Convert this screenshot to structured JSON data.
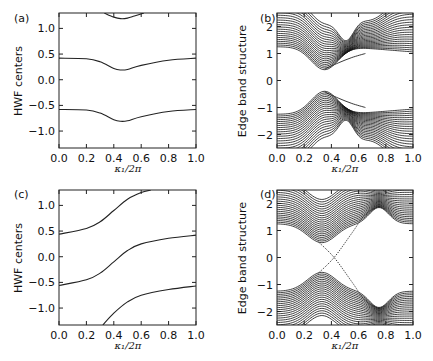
{
  "chart_data": [
    {
      "panel": "(a)",
      "type": "line",
      "xlabel": "κ₁/2π",
      "ylabel": "HWF centers",
      "xlim": [
        0.0,
        1.0
      ],
      "ylim": [
        -1.33,
        1.3
      ],
      "xticks": [
        "0.0",
        "0.2",
        "0.4",
        "0.6",
        "0.8",
        "1.0"
      ],
      "yticks": [
        "1.0",
        "0.5",
        "0.0",
        "−0.5",
        "−1.0"
      ],
      "ytick_values": [
        1.0,
        0.5,
        0.0,
        -0.5,
        -1.0
      ],
      "grid": false,
      "series": [
        {
          "name": "branch 1",
          "x": [
            0.0,
            0.2,
            0.3,
            0.4,
            0.45,
            0.5,
            0.6,
            0.8,
            1.0
          ],
          "values": [
            0.42,
            0.41,
            0.35,
            0.22,
            0.19,
            0.2,
            0.28,
            0.38,
            0.42
          ]
        },
        {
          "name": "branch 2",
          "x": [
            0.0,
            0.2,
            0.3,
            0.4,
            0.45,
            0.5,
            0.6,
            0.8,
            1.0
          ],
          "values": [
            -0.58,
            -0.59,
            -0.65,
            -0.78,
            -0.81,
            -0.8,
            -0.72,
            -0.62,
            -0.58
          ]
        },
        {
          "name": "branch 3",
          "x": [
            0.33,
            0.4,
            0.45,
            0.5,
            0.55,
            0.62
          ],
          "values": [
            1.3,
            1.22,
            1.19,
            1.2,
            1.24,
            1.3
          ]
        }
      ]
    },
    {
      "panel": "(b)",
      "type": "line",
      "xlabel": "κ₁/2π",
      "ylabel": "Edge band structure",
      "xlim": [
        0.0,
        1.0
      ],
      "ylim": [
        -2.5,
        2.5
      ],
      "xticks": [
        "0.0",
        "0.2",
        "0.4",
        "0.6",
        "0.8",
        "1.0"
      ],
      "yticks": [
        "2",
        "1",
        "0",
        "−1",
        "−2"
      ],
      "ytick_values": [
        2,
        1,
        0,
        -1,
        -2
      ],
      "grid": false,
      "description": "Dense bulk bands (~20 lines each) above and below a gap; upper bulk band minimum ≈0.4 at κ≈0.35, lower bulk band maximum ≈−0.4 at κ≈0.35; band crossings near κ≈0.52 at ±1.2; an edge state runs from ≈0.4 at κ≈0.35 to ≈1.0 at κ≈0.65 (upper) and mirrored in lower band; gapped (no crossing of zero).",
      "edge_states": [
        {
          "name": "upper edge state",
          "x": [
            0.35,
            0.45,
            0.55,
            0.65
          ],
          "values": [
            0.42,
            0.65,
            0.85,
            1.0
          ]
        },
        {
          "name": "lower edge state",
          "x": [
            0.35,
            0.45,
            0.55,
            0.65
          ],
          "values": [
            -0.42,
            -0.65,
            -0.85,
            -1.0
          ]
        }
      ]
    },
    {
      "panel": "(c)",
      "type": "line",
      "xlabel": "κ₁/2π",
      "ylabel": "HWF centers",
      "xlim": [
        0.0,
        1.0
      ],
      "ylim": [
        -1.33,
        1.3
      ],
      "xticks": [
        "0.0",
        "0.2",
        "0.4",
        "0.6",
        "0.8",
        "1.0"
      ],
      "yticks": [
        "1.0",
        "0.5",
        "0.0",
        "−0.5",
        "−1.0"
      ],
      "ytick_values": [
        1.0,
        0.5,
        0.0,
        -0.5,
        -1.0
      ],
      "grid": false,
      "series": [
        {
          "name": "branch 1",
          "x": [
            0.0,
            0.2,
            0.3,
            0.4,
            0.5,
            0.6,
            0.67
          ],
          "values": [
            0.44,
            0.55,
            0.68,
            0.9,
            1.12,
            1.25,
            1.3
          ]
        },
        {
          "name": "branch 2",
          "x": [
            0.0,
            0.2,
            0.3,
            0.4,
            0.5,
            0.6,
            0.8,
            1.0
          ],
          "values": [
            -0.56,
            -0.45,
            -0.32,
            -0.1,
            0.12,
            0.25,
            0.36,
            0.42
          ]
        },
        {
          "name": "branch 3",
          "x": [
            0.32,
            0.4,
            0.5,
            0.6,
            0.8,
            1.0
          ],
          "values": [
            -1.33,
            -1.1,
            -0.88,
            -0.75,
            -0.64,
            -0.57
          ]
        }
      ]
    },
    {
      "panel": "(d)",
      "type": "line",
      "xlabel": "κ₁/2π",
      "ylabel": "Edge band structure",
      "xlim": [
        0.0,
        1.0
      ],
      "ylim": [
        -2.5,
        2.5
      ],
      "xticks": [
        "0.0",
        "0.2",
        "0.4",
        "0.6",
        "0.8",
        "1.0"
      ],
      "yticks": [
        "2",
        "1",
        "0",
        "−1",
        "−2"
      ],
      "ytick_values": [
        2,
        1,
        0,
        -1,
        -2
      ],
      "grid": false,
      "description": "Dense bulk bands above and below; edge states cross the gap, intersecting at 0 near κ≈0.42; one edge state rises from ≈−0.6 at κ≈0.32 to ≈1.9 at κ≈0.75, the other falls from ≈0.6 at κ≈0.32 to ≈−1.9 at κ≈0.75 (topological).",
      "edge_states": [
        {
          "name": "rising edge state",
          "x": [
            0.3,
            0.42,
            0.55,
            0.65,
            0.75
          ],
          "values": [
            -0.6,
            0.0,
            0.9,
            1.6,
            1.9
          ]
        },
        {
          "name": "falling edge state",
          "x": [
            0.3,
            0.42,
            0.55,
            0.65,
            0.75
          ],
          "values": [
            0.6,
            0.0,
            -0.9,
            -1.6,
            -1.9
          ]
        }
      ]
    }
  ],
  "panels": {
    "a": {
      "label": "(a)",
      "ylabel": "HWF centers",
      "xlabel": "κ₁/2π"
    },
    "b": {
      "label": "(b)",
      "ylabel": "Edge band structure",
      "xlabel": "κ₁/2π"
    },
    "c": {
      "label": "(c)",
      "ylabel": "HWF centers",
      "xlabel": "κ₁/2π"
    },
    "d": {
      "label": "(d)",
      "ylabel": "Edge band structure",
      "xlabel": "κ₁/2π"
    }
  }
}
